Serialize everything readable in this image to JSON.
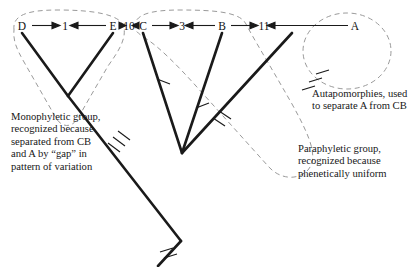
{
  "figure": {
    "background_color": "#ffffff",
    "line_color": "#1a1a1a",
    "dashed_color": "#8a8a8a"
  },
  "axis": {
    "description": "Top row of terminal taxa separated by phenetic distance values",
    "taxa": [
      {
        "id": "D",
        "label": "D",
        "x": 22
      },
      {
        "id": "E",
        "label": "E",
        "x": 113
      },
      {
        "id": "C",
        "label": "C",
        "x": 143
      },
      {
        "id": "B",
        "label": "B",
        "x": 222
      },
      {
        "id": "A",
        "label": "A",
        "x": 355
      }
    ],
    "distances": [
      {
        "label": "1",
        "between": "D-E",
        "x": 62
      },
      {
        "label": "10",
        "between": "E-C",
        "x": 128
      },
      {
        "label": "3",
        "between": "C-B",
        "x": 181
      },
      {
        "label": "11",
        "between": "B-A",
        "x": 262
      }
    ]
  },
  "captions": {
    "monophyletic": "Monophyletic group, recognized because separated from CB and A by “gap” in pattern of variation",
    "autapomorphies": "Autapomorphies, used to separate A from CB",
    "paraphyletic": "Paraphyletic group, recognized because phenetically uniform"
  },
  "groups": [
    {
      "name": "monophyletic-group-DE",
      "members": [
        "D",
        "E"
      ],
      "style": "dashed"
    },
    {
      "name": "paraphyletic-group-CB",
      "members": [
        "C",
        "B"
      ],
      "style": "dashed"
    },
    {
      "name": "autapomorphy-circle-A",
      "members": [
        "A"
      ],
      "style": "dashed"
    }
  ],
  "tree": {
    "nodes": [
      {
        "name": "tip-D",
        "x": 22,
        "y": 30
      },
      {
        "name": "tip-E",
        "x": 113,
        "y": 30
      },
      {
        "name": "tip-C",
        "x": 143,
        "y": 30
      },
      {
        "name": "tip-B",
        "x": 222,
        "y": 30
      },
      {
        "name": "tip-A",
        "x": 355,
        "y": 30
      },
      {
        "name": "node-DE",
        "x": 68,
        "y": 96
      },
      {
        "name": "node-CB",
        "x": 182,
        "y": 153
      },
      {
        "name": "root",
        "x": 181,
        "y": 241
      }
    ],
    "branch_marks": {
      "description": "Hatch marks on branches denoting character state changes",
      "counts": {
        "stem-DE": 3,
        "branch-C": 1,
        "branch-B": 1,
        "branch-A": 3,
        "stem-CB": 2,
        "root-stem": 2
      }
    }
  }
}
